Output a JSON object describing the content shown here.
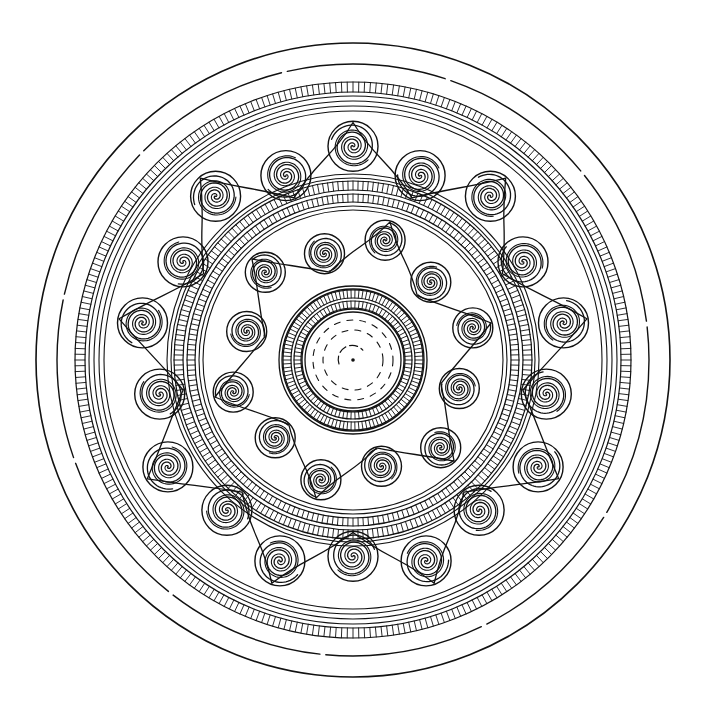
{
  "canvas": {
    "width": 705,
    "height": 713,
    "background": "#ffffff",
    "ink": "#111111"
  },
  "disc": {
    "center": {
      "x": 353,
      "y": 360
    },
    "outer_rings": [
      {
        "name": "outer-rim",
        "r": 317,
        "width": 1.6,
        "dashed": false
      },
      {
        "name": "second-rim",
        "r": 296,
        "width": 1.4,
        "dashed": true
      }
    ],
    "outer_hatched_band": {
      "r_inner": 268,
      "r_outer": 278,
      "ticks": 300
    },
    "outer_concentric_lines": [
      264,
      259,
      254,
      249
    ],
    "outer_spiral_ring": {
      "count": 18,
      "r": 205,
      "spiral_radius": 25,
      "turns": 3.2,
      "start_angle_deg": -90
    },
    "middle_lines_outer": [
      186,
      182
    ],
    "middle_hatched_bands": [
      {
        "r_inner": 170,
        "r_outer": 179,
        "ticks": 220
      },
      {
        "r_inner": 158,
        "r_outer": 166,
        "ticks": 200
      }
    ],
    "middle_lines_inner": [
      154,
      150
    ],
    "inner_spiral_ring": {
      "count": 12,
      "r": 117,
      "spiral_radius": 20,
      "turns": 3,
      "start_angle_deg": -75
    },
    "medallion": {
      "lines": [
        74,
        71,
        51,
        48
      ],
      "hatched_bands": [
        {
          "r_inner": 62,
          "r_outer": 70,
          "ticks": 110
        },
        {
          "r_inner": 52,
          "r_outer": 59,
          "ticks": 90
        }
      ],
      "dashed_circles": [
        40,
        30
      ],
      "inner_arc_r": 14,
      "center_dot_r": 1.8
    }
  }
}
